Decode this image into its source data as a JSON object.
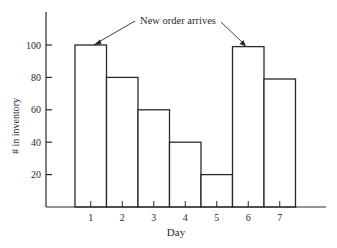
{
  "chart_data": {
    "type": "bar",
    "title": "",
    "xlabel": "Day",
    "ylabel": "# in inventory",
    "categories": [
      "1",
      "2",
      "3",
      "4",
      "5",
      "6",
      "7"
    ],
    "values": [
      100,
      80,
      60,
      40,
      20,
      99,
      79
    ],
    "yticks": [
      20,
      40,
      60,
      80,
      100
    ],
    "ylim": [
      0,
      120
    ],
    "grid": false,
    "legend": null,
    "annotations": [
      {
        "text": "New order arrives",
        "points_to": [
          "1",
          "6"
        ]
      }
    ]
  },
  "colors": {
    "ink": "#2a2a2a",
    "bar_fill": "#ffffff",
    "background": "#ffffff"
  }
}
